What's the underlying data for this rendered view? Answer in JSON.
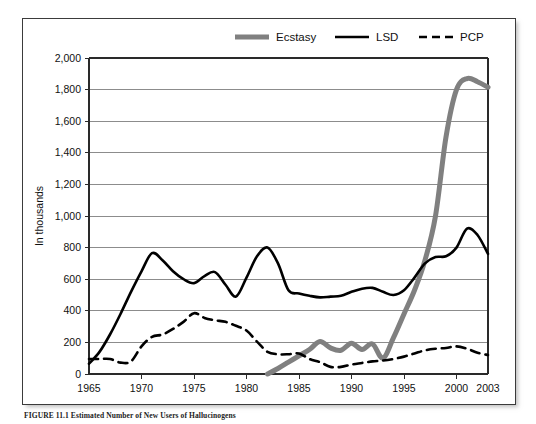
{
  "figure": {
    "caption": "FIGURE 11.1  Estimated Number of New Users of Hallucinogens",
    "background": "#ffffff",
    "frame_color": "#3b3b3b"
  },
  "legend": {
    "position": "top-center",
    "entries": [
      {
        "label": "Ecstasy",
        "color": "#808080",
        "style": "thick-solid"
      },
      {
        "label": "LSD",
        "color": "#000000",
        "style": "solid"
      },
      {
        "label": "PCP",
        "color": "#000000",
        "style": "dashed"
      }
    ]
  },
  "chart_data": {
    "type": "line",
    "title": "",
    "subtitle": "",
    "xlabel": "",
    "ylabel": "In thousands",
    "xlim": [
      1965,
      2003
    ],
    "ylim": [
      0,
      2000
    ],
    "grid": true,
    "legend_position": "top-center",
    "xticks": [
      1965,
      1970,
      1975,
      1980,
      1985,
      1990,
      1995,
      2000,
      2003
    ],
    "xtick_labels": [
      "1965",
      "1970",
      "1975",
      "1980",
      "1985",
      "1990",
      "1995",
      "2000",
      "2003"
    ],
    "yticks": [
      0,
      200,
      400,
      600,
      800,
      1000,
      1200,
      1400,
      1600,
      1800,
      2000
    ],
    "ytick_labels": [
      "0",
      "200",
      "400",
      "600",
      "800",
      "1,000",
      "1,200",
      "1,400",
      "1,600",
      "1,800",
      "2,000"
    ],
    "series": [
      {
        "name": "LSD",
        "color": "#000000",
        "width": 2.6,
        "dash": "none",
        "x": [
          1965,
          1966,
          1967,
          1968,
          1969,
          1970,
          1971,
          1972,
          1973,
          1974,
          1975,
          1976,
          1977,
          1978,
          1979,
          1980,
          1981,
          1982,
          1983,
          1984,
          1985,
          1986,
          1987,
          1988,
          1989,
          1990,
          1991,
          1992,
          1993,
          1994,
          1995,
          1996,
          1997,
          1998,
          1999,
          2000,
          2001,
          2002,
          2003
        ],
        "values": [
          65,
          140,
          250,
          380,
          520,
          650,
          765,
          720,
          650,
          600,
          575,
          620,
          645,
          565,
          490,
          610,
          745,
          800,
          700,
          530,
          510,
          495,
          485,
          490,
          495,
          520,
          540,
          545,
          520,
          500,
          530,
          610,
          700,
          740,
          745,
          800,
          920,
          880,
          760
        ]
      },
      {
        "name": "PCP",
        "color": "#000000",
        "width": 2.6,
        "dash": "9,6",
        "x": [
          1965,
          1966,
          1967,
          1968,
          1969,
          1970,
          1971,
          1972,
          1973,
          1974,
          1975,
          1976,
          1977,
          1978,
          1979,
          1980,
          1981,
          1982,
          1983,
          1984,
          1985,
          1986,
          1987,
          1988,
          1989,
          1990,
          1991,
          1992,
          1993,
          1994,
          1995,
          1996,
          1997,
          1998,
          1999,
          2000,
          2001,
          2002,
          2003
        ],
        "values": [
          95,
          95,
          95,
          72,
          80,
          175,
          235,
          250,
          285,
          330,
          385,
          355,
          340,
          330,
          305,
          275,
          205,
          140,
          125,
          125,
          130,
          95,
          75,
          45,
          45,
          60,
          70,
          80,
          85,
          95,
          110,
          130,
          150,
          160,
          165,
          175,
          160,
          135,
          120
        ]
      },
      {
        "name": "Ecstasy",
        "color": "#808080",
        "width": 5.0,
        "dash": "none",
        "x": [
          1982,
          1983,
          1984,
          1985,
          1986,
          1987,
          1988,
          1989,
          1990,
          1991,
          1992,
          1993,
          1994,
          1995,
          1996,
          1997,
          1998,
          1999,
          2000,
          2001,
          2002,
          2003
        ],
        "values": [
          0,
          35,
          75,
          115,
          155,
          205,
          165,
          150,
          195,
          155,
          190,
          100,
          230,
          380,
          530,
          720,
          1000,
          1500,
          1800,
          1870,
          1850,
          1815
        ]
      }
    ]
  }
}
